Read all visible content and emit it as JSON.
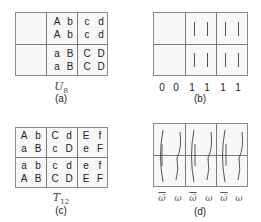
{
  "panel_a": {
    "caption": "(a)",
    "math_label_base": "U",
    "math_label_sub": "8",
    "rows": [
      [
        "",
        "",
        "A",
        "b",
        "c",
        "d"
      ],
      [
        "",
        "",
        "A",
        "b",
        "c",
        "d"
      ],
      [
        "",
        "",
        "a",
        "B",
        "C",
        "D"
      ],
      [
        "",
        "",
        "a",
        "B",
        "C",
        "D"
      ]
    ]
  },
  "panel_b": {
    "caption": "(b)",
    "bits": [
      "0",
      "0",
      "1",
      "1",
      "1",
      "1"
    ]
  },
  "panel_c": {
    "caption": "(c)",
    "math_label_base": "T",
    "math_label_sub": "12",
    "rows": [
      [
        "A",
        "b",
        "C",
        "d",
        "E",
        "f"
      ],
      [
        "a",
        "B",
        "c",
        "D",
        "e",
        "F"
      ],
      [
        "a",
        "b",
        "c",
        "d",
        "e",
        "f"
      ],
      [
        "A",
        "B",
        "C",
        "D",
        "E",
        "F"
      ]
    ]
  },
  "panel_d": {
    "caption": "(d)",
    "labels": [
      "ω̄",
      "ω",
      "ω̄",
      "ω",
      "ω̄",
      "ω"
    ]
  }
}
